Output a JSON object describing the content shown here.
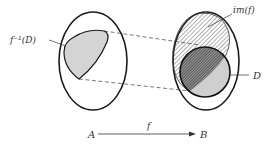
{
  "diagram": {
    "type": "set-mapping",
    "labels": {
      "preimage": "f⁻¹(D)",
      "image": "im(f)",
      "subset": "D",
      "domain": "A",
      "codomain": "B",
      "function": "f"
    },
    "colors": {
      "stroke": "#1a1a1a",
      "preimage_fill": "#d4d4d4",
      "subset_fill": "#cfcfcf",
      "hatch": "#333333",
      "dash": "#555555"
    },
    "sets": [
      {
        "id": "A",
        "shape": "ellipse",
        "cx": 93,
        "cy": 61,
        "rx": 34,
        "ry": 49
      },
      {
        "id": "B",
        "shape": "ellipse",
        "cx": 206,
        "cy": 61,
        "rx": 33,
        "ry": 49
      },
      {
        "id": "D",
        "shape": "circle",
        "cx": 205,
        "cy": 72,
        "r": 25
      }
    ]
  }
}
